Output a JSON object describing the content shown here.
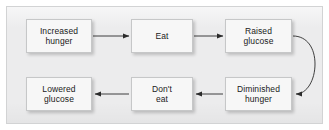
{
  "figure": {
    "type": "flow-diagram",
    "title": "",
    "background_color": "#ececed",
    "frame_border_color": "#d2d3d4",
    "node_fill_color": "#f7f7f7",
    "node_border_color": "#c6c7c8",
    "connector_color": "#2b2b2b",
    "text_color": "#1a1a1a"
  },
  "nodes": [
    {
      "id": "increased-hunger",
      "label": "Increased\nhunger",
      "row": "top",
      "column": 1
    },
    {
      "id": "eat",
      "label": "Eat",
      "row": "top",
      "column": 2
    },
    {
      "id": "raised-glucose",
      "label": "Raised\nglucose",
      "row": "top",
      "column": 3
    },
    {
      "id": "lowered-glucose",
      "label": "Lowered\nglucose",
      "row": "bottom",
      "column": 1
    },
    {
      "id": "dont-eat",
      "label": "Don't\neat",
      "row": "bottom",
      "column": 2
    },
    {
      "id": "diminished-hunger",
      "label": "Diminished\nhunger",
      "row": "bottom",
      "column": 3
    }
  ],
  "edges": [
    {
      "id": "e1",
      "from": "increased-hunger",
      "to": "eat",
      "style": "straight",
      "direction": "right"
    },
    {
      "id": "e2",
      "from": "eat",
      "to": "raised-glucose",
      "style": "straight",
      "direction": "right"
    },
    {
      "id": "e3",
      "from": "raised-glucose",
      "to": "diminished-hunger",
      "style": "curved",
      "direction": "left"
    },
    {
      "id": "e4",
      "from": "diminished-hunger",
      "to": "dont-eat",
      "style": "straight",
      "direction": "left"
    },
    {
      "id": "e5",
      "from": "dont-eat",
      "to": "lowered-glucose",
      "style": "straight",
      "direction": "left"
    }
  ]
}
